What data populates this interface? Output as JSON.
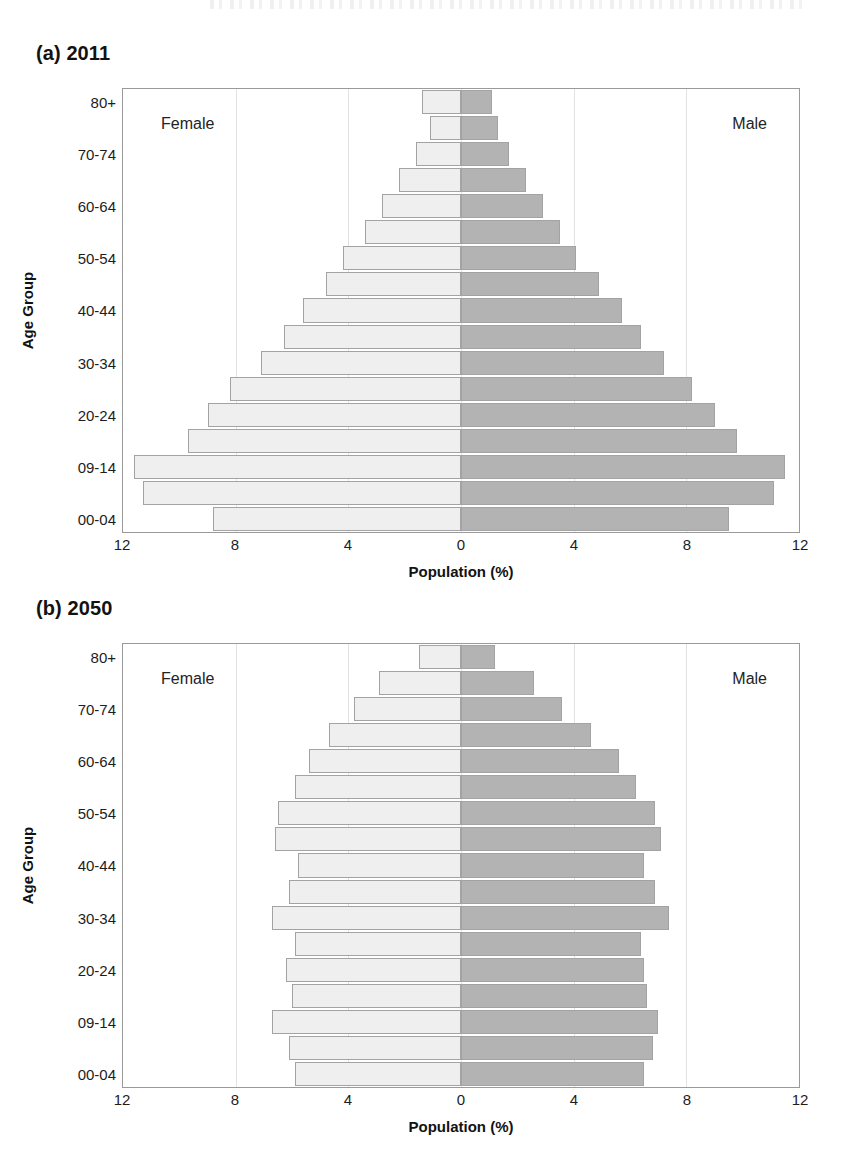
{
  "figure": {
    "axis_titles": {
      "x": "Population (%)",
      "y": "Age Group"
    },
    "series_labels": {
      "female": "Female",
      "male": "Male"
    },
    "x_ticks": [
      "12",
      "8",
      "4",
      "0",
      "4",
      "8",
      "12"
    ],
    "age_groups": [
      "00-04",
      "05-09",
      "09-14",
      "15-19",
      "20-24",
      "25-29",
      "30-34",
      "35-39",
      "40-44",
      "45-49",
      "50-54",
      "55-59",
      "60-64",
      "65-69",
      "70-74",
      "75-79",
      "80+"
    ],
    "y_tick_labels": [
      "00-04",
      "09-14",
      "20-24",
      "30-34",
      "40-44",
      "50-54",
      "60-64",
      "70-74",
      "80+"
    ],
    "colors": {
      "female": "#efefef",
      "male": "#b3b3b3",
      "bar_border": "#a3a3a3",
      "grid": "#e2e2e2",
      "axis": "#9a9a9a"
    }
  },
  "panels": [
    {
      "id": "panel-a",
      "title": "(a) 2011",
      "chart_data": {
        "type": "bar",
        "title": "(a) 2011",
        "xlabel": "Population (%)",
        "ylabel": "Age Group",
        "xlim": [
          -12,
          12
        ],
        "grid": true,
        "legend": "inside-labels",
        "categories": [
          "00-04",
          "05-09",
          "09-14",
          "15-19",
          "20-24",
          "25-29",
          "30-34",
          "35-39",
          "40-44",
          "45-49",
          "50-54",
          "55-59",
          "60-64",
          "65-69",
          "70-74",
          "75-79",
          "80+"
        ],
        "series": [
          {
            "name": "Female",
            "values": [
              8.8,
              11.3,
              11.6,
              9.7,
              9.0,
              8.2,
              7.1,
              6.3,
              5.6,
              4.8,
              4.2,
              3.4,
              2.8,
              2.2,
              1.6,
              1.1,
              1.4
            ]
          },
          {
            "name": "Male",
            "values": [
              9.5,
              11.1,
              11.5,
              9.8,
              9.0,
              8.2,
              7.2,
              6.4,
              5.7,
              4.9,
              4.1,
              3.5,
              2.9,
              2.3,
              1.7,
              1.3,
              1.1
            ]
          }
        ]
      }
    },
    {
      "id": "panel-b",
      "title": "(b) 2050",
      "chart_data": {
        "type": "bar",
        "title": "(b) 2050",
        "xlabel": "Population (%)",
        "ylabel": "Age Group",
        "xlim": [
          -12,
          12
        ],
        "grid": true,
        "legend": "inside-labels",
        "categories": [
          "00-04",
          "05-09",
          "09-14",
          "15-19",
          "20-24",
          "25-29",
          "30-34",
          "35-39",
          "40-44",
          "45-49",
          "50-54",
          "55-59",
          "60-64",
          "65-69",
          "70-74",
          "75-79",
          "80+"
        ],
        "series": [
          {
            "name": "Female",
            "values": [
              5.9,
              6.1,
              6.7,
              6.0,
              6.2,
              5.9,
              6.7,
              6.1,
              5.8,
              6.6,
              6.5,
              5.9,
              5.4,
              4.7,
              3.8,
              2.9,
              1.5
            ]
          },
          {
            "name": "Male",
            "values": [
              6.5,
              6.8,
              7.0,
              6.6,
              6.5,
              6.4,
              7.4,
              6.9,
              6.5,
              7.1,
              6.9,
              6.2,
              5.6,
              4.6,
              3.6,
              2.6,
              1.2
            ]
          }
        ]
      }
    }
  ]
}
